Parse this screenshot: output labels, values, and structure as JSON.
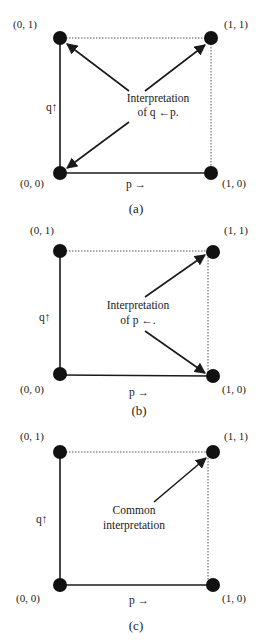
{
  "panels": [
    {
      "id": "a",
      "caption": "(a)",
      "corners": {
        "tl": "(0, 1)",
        "tr": "(1, 1)",
        "bl": "(0, 0)",
        "br": "(1, 0)"
      },
      "x_axis_label": "p →",
      "y_axis_label": "q↑",
      "annotation": [
        "Interpretation",
        "of q ←p."
      ],
      "arrow_targets": [
        "(0, 1)",
        "(1, 1)",
        "(0, 0)"
      ]
    },
    {
      "id": "b",
      "caption": "(b)",
      "corners": {
        "tl": "(0, 1)",
        "tr": "(1, 1)",
        "bl": "(0, 0)",
        "br": "(1, 0)"
      },
      "x_axis_label": "p →",
      "y_axis_label": "q↑",
      "annotation": [
        "Interpretation",
        "of  p ←."
      ],
      "arrow_targets": [
        "(1, 1)",
        "(1, 0)"
      ]
    },
    {
      "id": "c",
      "caption": "(c)",
      "corners": {
        "tl": "(0, 1)",
        "tr": "(1, 1)",
        "bl": "(0, 0)",
        "br": "(1, 0)"
      },
      "x_axis_label": "p →",
      "y_axis_label": "q↑",
      "annotation": [
        "Common",
        "interpretation"
      ],
      "arrow_targets": [
        "(1, 1)"
      ]
    }
  ]
}
